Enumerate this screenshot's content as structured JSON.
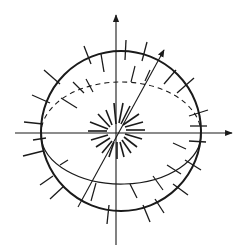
{
  "diagram": {
    "type": "sphere-with-axes",
    "colors": {
      "background": "#ffffff",
      "stroke": "#1a1a1a"
    },
    "sphere": {
      "cx": 121,
      "cy": 131,
      "r": 80
    },
    "equator": {
      "cx": 121,
      "cy": 134,
      "rx": 80,
      "ry": 50,
      "back_dashed": true
    },
    "axes": [
      {
        "name": "vertical-axis",
        "x1": 116,
        "y1": 245,
        "x2": 116,
        "y2": 14,
        "arrow": true
      },
      {
        "name": "horizontal-axis",
        "x1": 15,
        "y1": 133,
        "x2": 233,
        "y2": 133,
        "arrow": true
      },
      {
        "name": "tilted-axis",
        "x1": 78,
        "y1": 207,
        "x2": 164,
        "y2": 49,
        "arrow": true
      }
    ],
    "labels": []
  }
}
